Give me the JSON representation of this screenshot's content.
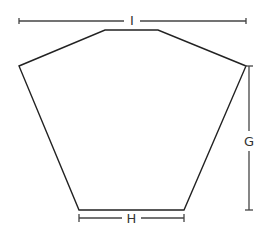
{
  "diagram": {
    "shape": "hexagon",
    "dimensions": {
      "width_label": "I",
      "base_label": "H",
      "height_label": "G"
    },
    "colors": {
      "stroke": "#222222",
      "dimension": "#444444",
      "background": "#ffffff"
    }
  }
}
